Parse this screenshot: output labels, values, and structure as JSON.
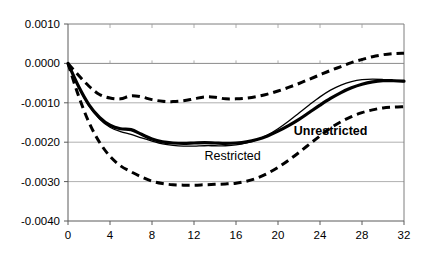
{
  "chart_data": {
    "type": "line",
    "title": "",
    "subtitle": "",
    "xlabel": "",
    "ylabel": "",
    "xlim": [
      0,
      32
    ],
    "ylim": [
      -0.004,
      0.001
    ],
    "grid": true,
    "legend_position": "inline-annotations",
    "x_tick_labels": [
      "0",
      "4",
      "8",
      "12",
      "16",
      "20",
      "24",
      "28",
      "32"
    ],
    "x_ticks": [
      0,
      4,
      8,
      12,
      16,
      20,
      24,
      28,
      32
    ],
    "y_tick_labels": [
      "0.0010",
      "0.0000",
      "-0.0010",
      "-0.0020",
      "-0.0030",
      "-0.0040"
    ],
    "y_ticks": [
      0.001,
      0.0,
      -0.001,
      -0.002,
      -0.003,
      -0.004
    ],
    "annotations": [
      {
        "text": "Restricted",
        "x": 13.0,
        "y": -0.00245,
        "bold": false
      },
      {
        "text": "Unrestricted",
        "x": 21.5,
        "y": -0.00182,
        "bold": true
      }
    ],
    "x": [
      0,
      1,
      2,
      3,
      4,
      5,
      6,
      7,
      8,
      9,
      10,
      11,
      12,
      13,
      14,
      15,
      16,
      17,
      18,
      19,
      20,
      21,
      22,
      23,
      24,
      25,
      26,
      27,
      28,
      29,
      30,
      31,
      32
    ],
    "series": [
      {
        "name": "Unrestricted",
        "style": "solid-thick",
        "values": [
          0.0,
          -0.00058,
          -0.00105,
          -0.00137,
          -0.00157,
          -0.00166,
          -0.00168,
          -0.0018,
          -0.00192,
          -0.00199,
          -0.00202,
          -0.00203,
          -0.00202,
          -0.00201,
          -0.00202,
          -0.00203,
          -0.00202,
          -0.00199,
          -0.00193,
          -0.00184,
          -0.00172,
          -0.00158,
          -0.00142,
          -0.00124,
          -0.00106,
          -0.00089,
          -0.00074,
          -0.00062,
          -0.00053,
          -0.00047,
          -0.00044,
          -0.00044,
          -0.00045
        ]
      },
      {
        "name": "Restricted",
        "style": "solid-thin",
        "values": [
          0.0,
          -0.0006,
          -0.00108,
          -0.00141,
          -0.00162,
          -0.00173,
          -0.0018,
          -0.00189,
          -0.00197,
          -0.00204,
          -0.00208,
          -0.0021,
          -0.0021,
          -0.00209,
          -0.00209,
          -0.00209,
          -0.00207,
          -0.00202,
          -0.00194,
          -0.00182,
          -0.00166,
          -0.00147,
          -0.00126,
          -0.00105,
          -0.00085,
          -0.00068,
          -0.00055,
          -0.00046,
          -0.00041,
          -0.0004,
          -0.00041,
          -0.00043,
          -0.00046
        ]
      },
      {
        "name": "Upper confidence band",
        "style": "dashed",
        "values": [
          0.0,
          -0.0003,
          -0.00058,
          -0.00079,
          -0.00088,
          -0.0009,
          -0.00082,
          -0.00085,
          -0.00092,
          -0.00096,
          -0.00097,
          -0.00095,
          -0.0009,
          -0.00085,
          -0.00086,
          -0.0009,
          -0.0009,
          -0.00088,
          -0.00084,
          -0.00078,
          -0.0007,
          -0.00061,
          -0.00051,
          -0.0004,
          -0.00029,
          -0.00018,
          -8e-05,
          2e-05,
          0.0001,
          0.00017,
          0.00022,
          0.00025,
          0.00026
        ]
      },
      {
        "name": "Lower confidence band",
        "style": "dashed",
        "values": [
          0.0,
          -0.00082,
          -0.0015,
          -0.002,
          -0.00236,
          -0.0026,
          -0.00275,
          -0.00288,
          -0.00299,
          -0.00305,
          -0.00308,
          -0.00309,
          -0.00309,
          -0.00308,
          -0.00307,
          -0.00306,
          -0.00304,
          -0.00299,
          -0.00291,
          -0.00279,
          -0.00264,
          -0.00246,
          -0.00226,
          -0.00205,
          -0.00184,
          -0.00164,
          -0.00148,
          -0.00135,
          -0.00125,
          -0.00118,
          -0.00113,
          -0.00111,
          -0.0011
        ]
      }
    ]
  }
}
